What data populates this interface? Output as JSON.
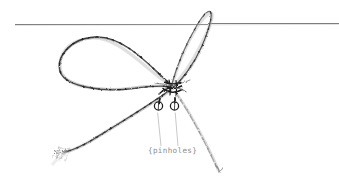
{
  "figure": {
    "background_color": "#ffffff",
    "width": 339,
    "height": 185
  },
  "annotation": {
    "label": "{pinholes}",
    "label_color": "#8d8d8d",
    "label_x": 148,
    "label_y": 153,
    "leader_color": "#b5b5b5"
  },
  "pinholes": [
    {
      "name": "pinhole-left",
      "cx": 158.5,
      "cy": 106,
      "r": 4.1,
      "stroke": "#1c1c1c"
    },
    {
      "name": "pinhole-right",
      "cx": 174.5,
      "cy": 106,
      "r": 4.1,
      "stroke": "#1c1c1c"
    }
  ],
  "leader_lines": [
    {
      "name": "leader-to-left-pinhole",
      "x1": 161,
      "y1": 146,
      "x2": 157.5,
      "y2": 113
    },
    {
      "name": "leader-to-right-pinhole",
      "x1": 178,
      "y1": 146,
      "x2": 175,
      "y2": 113
    }
  ],
  "guide_line": {
    "name": "horizontal-reference-line",
    "x1": 15,
    "y1": 24.5,
    "x2": 339,
    "y2": 23.5,
    "color": "#6f6f70",
    "width": 0.9
  },
  "string": {
    "name": "tied-string-bow",
    "ink_dark": "#2b2b2b",
    "ink_mid": "#6a6a6a",
    "ink_light": "#b9b9b9",
    "ink_faint": "#d6d6d6",
    "knot_center_x": 172,
    "knot_center_y": 86,
    "parts": [
      "left-loop",
      "right-loop",
      "lower-left-tail",
      "lower-right-tail",
      "knot-cluster",
      "frayed-end"
    ]
  },
  "colors": {
    "background": "#ffffff",
    "line": "#6f6f70",
    "text": "#8d8d8d",
    "ink": "#2b2b2b"
  }
}
